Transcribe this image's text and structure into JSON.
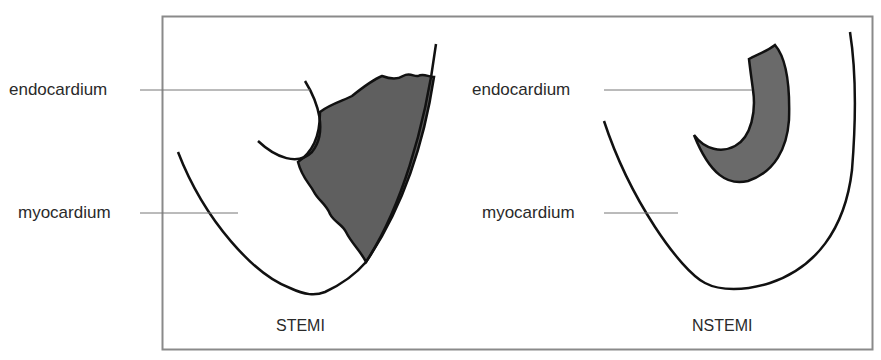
{
  "figure": {
    "panels": [
      {
        "id": "stemi",
        "caption": "STEMI",
        "labels": {
          "endocardium": "endocardium",
          "myocardium": "myocardium"
        },
        "description": "Transmural infarction: shaded region spans full wall thickness from endocardium to epicardium"
      },
      {
        "id": "nstemi",
        "caption": "NSTEMI",
        "labels": {
          "endocardium": "endocardium",
          "myocardium": "myocardium"
        },
        "description": "Subendocardial infarction: shaded region confined to inner endocardial layer"
      }
    ],
    "colors": {
      "frame": "#8a8a8a",
      "outline": "#111111",
      "infarct_fill": "#5f5f5f",
      "leader_line": "#777777",
      "text": "#2a2a2a"
    }
  }
}
